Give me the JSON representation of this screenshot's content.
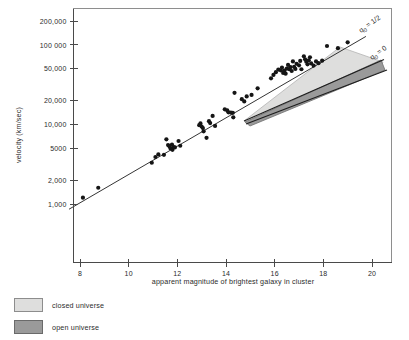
{
  "figure": {
    "background": "#ffffff",
    "frame_color": "#8e8e8e",
    "axis_color": "#4a4a4a"
  },
  "chart_data": {
    "type": "scatter",
    "title": "",
    "subtitle": "",
    "xlabel": "apparent magnitude of brightest galaxy in cluster",
    "ylabel": "velocity (km/sec)",
    "xscale": "linear",
    "yscale": "log",
    "xlim": [
      7.4,
      20.9
    ],
    "ylim": [
      800,
      260000
    ],
    "grid": false,
    "legend_position": "below-axes-left",
    "x_ticks": [
      8,
      10,
      12,
      14,
      16,
      18,
      20
    ],
    "x_tick_labels": [
      "8",
      "10",
      "12",
      "14",
      "16",
      "18",
      "20"
    ],
    "y_ticks": [
      1000,
      2000,
      5000,
      10000,
      20000,
      50000,
      100000,
      200000
    ],
    "y_tick_labels": [
      "1,000",
      "2,000",
      "5000",
      "10,000",
      "20,000",
      "50,000",
      "100 000",
      "200,000"
    ],
    "series": [
      {
        "name": "clusters",
        "type": "scatter",
        "marker": "filled-circle",
        "color": "#151515",
        "points": [
          [
            8.12,
            1200
          ],
          [
            8.75,
            1600
          ],
          [
            10.95,
            3300
          ],
          [
            11.1,
            3900
          ],
          [
            11.22,
            4200
          ],
          [
            11.45,
            4150
          ],
          [
            11.55,
            6500
          ],
          [
            11.62,
            5500
          ],
          [
            11.68,
            5300
          ],
          [
            11.72,
            5000
          ],
          [
            11.78,
            5600
          ],
          [
            11.8,
            4800
          ],
          [
            11.85,
            5200
          ],
          [
            11.9,
            5150
          ],
          [
            12.05,
            6200
          ],
          [
            12.12,
            5400
          ],
          [
            12.9,
            9800
          ],
          [
            12.95,
            10300
          ],
          [
            13.0,
            9400
          ],
          [
            13.05,
            9000
          ],
          [
            13.08,
            8200
          ],
          [
            13.2,
            6800
          ],
          [
            13.3,
            11000
          ],
          [
            13.35,
            10400
          ],
          [
            13.45,
            12800
          ],
          [
            13.55,
            9600
          ],
          [
            13.95,
            15500
          ],
          [
            14.05,
            15000
          ],
          [
            14.1,
            14200
          ],
          [
            14.2,
            14100
          ],
          [
            14.28,
            14000
          ],
          [
            14.3,
            12300
          ],
          [
            14.35,
            25000
          ],
          [
            14.65,
            20800
          ],
          [
            14.75,
            19500
          ],
          [
            14.85,
            22500
          ],
          [
            15.05,
            23500
          ],
          [
            15.3,
            28500
          ],
          [
            15.85,
            38000
          ],
          [
            15.95,
            42000
          ],
          [
            16.05,
            45500
          ],
          [
            16.15,
            49000
          ],
          [
            16.25,
            48000
          ],
          [
            16.3,
            52000
          ],
          [
            16.35,
            44500
          ],
          [
            16.4,
            47500
          ],
          [
            16.45,
            43500
          ],
          [
            16.5,
            50500
          ],
          [
            16.55,
            56000
          ],
          [
            16.6,
            49500
          ],
          [
            16.65,
            52500
          ],
          [
            16.7,
            47000
          ],
          [
            16.75,
            62000
          ],
          [
            16.8,
            53000
          ],
          [
            16.85,
            50000
          ],
          [
            16.9,
            58000
          ],
          [
            17.0,
            55500
          ],
          [
            17.05,
            63000
          ],
          [
            17.1,
            49500
          ],
          [
            17.2,
            72000
          ],
          [
            17.25,
            66000
          ],
          [
            17.3,
            61500
          ],
          [
            17.35,
            57000
          ],
          [
            17.4,
            64000
          ],
          [
            17.45,
            70000
          ],
          [
            17.5,
            58500
          ],
          [
            17.6,
            55000
          ],
          [
            17.7,
            62000
          ],
          [
            17.8,
            59000
          ],
          [
            17.95,
            63500
          ],
          [
            18.15,
            97000
          ],
          [
            18.6,
            91000
          ],
          [
            19.0,
            108000
          ]
        ]
      }
    ],
    "fit_line": {
      "name": "hubble-fit",
      "color": "#1d1d1d",
      "from": [
        7.55,
        860
      ],
      "to": [
        19.75,
        128000
      ]
    },
    "model_bands": [
      {
        "name": "closed universe",
        "label": "closed universe",
        "fill": "#dededd",
        "stroke": "#b4b4b4",
        "q0": "1/2"
      },
      {
        "name": "open universe",
        "label": "open universe",
        "fill": "#9a9a9a",
        "stroke": "#6e6e6e",
        "q0": "0"
      }
    ],
    "annotations": [
      {
        "name": "q0-half",
        "text_main": "q",
        "text_sub": "0",
        "text_rest": " = 1/2",
        "x": 19.55,
        "y": 175000,
        "rotation": -36
      },
      {
        "name": "q0-zero",
        "text_main": "q",
        "text_sub": "0",
        "text_rest": " = 0",
        "x": 20.1,
        "y": 108000,
        "rotation": -36
      }
    ]
  },
  "legend": {
    "items": [
      {
        "label": "closed universe",
        "color": "#dededd",
        "border": "#8d8d8d"
      },
      {
        "label": "open universe",
        "color": "#9a9a9a",
        "border": "#6a6a6a"
      }
    ]
  }
}
